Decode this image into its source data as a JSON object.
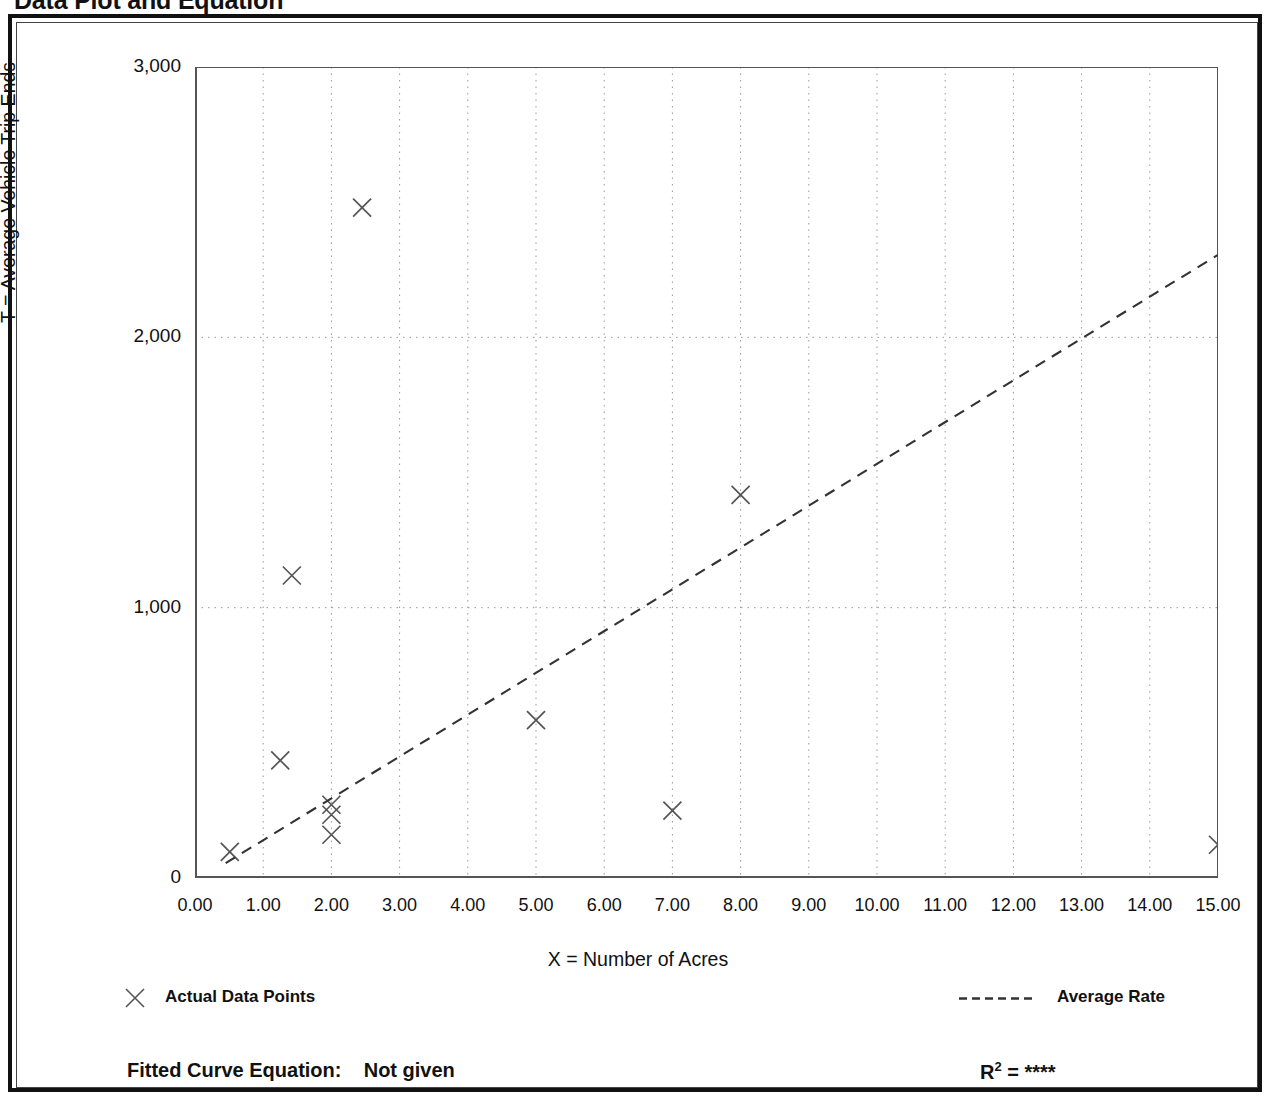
{
  "page": {
    "title": "Data Plot and Equation"
  },
  "footer": {
    "equation_label": "Fitted Curve Equation:",
    "equation_value": "Not given",
    "r2_base": "R",
    "r2_exponent": "2",
    "r2_equals": "=",
    "r2_value": "****"
  },
  "legend": {
    "items": [
      {
        "label": "Actual Data Points",
        "marker": "x-marker-icon",
        "color": "#555555"
      },
      {
        "label": "Average Rate",
        "marker": "dashed-line-icon",
        "color": "#333333"
      }
    ]
  },
  "colors": {
    "frame": "#111111",
    "axis": "#555555",
    "grid": "#999999",
    "marker": "#555555",
    "trendline": "#333333",
    "background": "#ffffff"
  },
  "chart_data": {
    "type": "scatter",
    "title": "Data Plot and Equation",
    "xlabel": "X = Number of Acres",
    "ylabel": "T = Average Vehicle Trip Ends",
    "xlim": [
      0,
      15
    ],
    "ylim": [
      0,
      3000
    ],
    "xticks": [
      0,
      1,
      2,
      3,
      4,
      5,
      6,
      7,
      8,
      9,
      10,
      11,
      12,
      13,
      14,
      15
    ],
    "xtick_labels": [
      "0.00",
      "1.00",
      "2.00",
      "3.00",
      "4.00",
      "5.00",
      "6.00",
      "7.00",
      "8.00",
      "9.00",
      "10.00",
      "11.00",
      "12.00",
      "13.00",
      "14.00",
      "15.00"
    ],
    "xminor_ticks": [
      0.5,
      1.5,
      2.5,
      3.5,
      4.5,
      5.5,
      6.5,
      7.5,
      8.5,
      9.5,
      10.5,
      11.5,
      12.5,
      13.5,
      14.5
    ],
    "yticks": [
      0,
      1000,
      2000,
      3000
    ],
    "ytick_labels": [
      "0",
      "1,000",
      "2,000",
      "3,000"
    ],
    "yminor_ticks": [
      500,
      1500,
      2500
    ],
    "grid": true,
    "grid_style": "dotted",
    "legend_position": "below-plot",
    "marker": "x",
    "series": [
      {
        "name": "Actual Data Points",
        "type": "scatter",
        "points": [
          {
            "x": 0.51,
            "y": 97
          },
          {
            "x": 1.25,
            "y": 435
          },
          {
            "x": 1.42,
            "y": 1119
          },
          {
            "x": 2.0,
            "y": 271
          },
          {
            "x": 2.0,
            "y": 234
          },
          {
            "x": 2.0,
            "y": 160
          },
          {
            "x": 2.45,
            "y": 2480
          },
          {
            "x": 5.0,
            "y": 584
          },
          {
            "x": 7.0,
            "y": 249
          },
          {
            "x": 8.0,
            "y": 1417
          },
          {
            "x": 15.0,
            "y": 123
          }
        ]
      },
      {
        "name": "Average Rate",
        "type": "line",
        "style": "dashed",
        "endpoints": [
          {
            "x": 0.45,
            "y": 55
          },
          {
            "x": 15.0,
            "y": 2305
          }
        ]
      }
    ]
  }
}
